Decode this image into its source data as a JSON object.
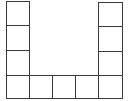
{
  "diagram": {
    "type": "grid-shape",
    "line_color": "#3a3a3a",
    "background": "#ffffff",
    "cell_size": 23,
    "columns": 5,
    "rows": 4,
    "cells": [
      {
        "col": 0,
        "row": 0
      },
      {
        "col": 0,
        "row": 1
      },
      {
        "col": 0,
        "row": 2
      },
      {
        "col": 0,
        "row": 3
      },
      {
        "col": 1,
        "row": 3
      },
      {
        "col": 2,
        "row": 3
      },
      {
        "col": 3,
        "row": 3
      },
      {
        "col": 4,
        "row": 3
      },
      {
        "col": 4,
        "row": 2
      },
      {
        "col": 4,
        "row": 1
      },
      {
        "col": 4,
        "row": 0
      }
    ],
    "cell_count": 11
  }
}
